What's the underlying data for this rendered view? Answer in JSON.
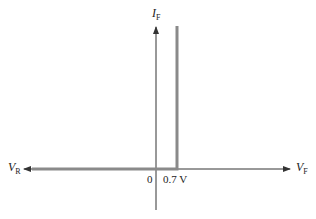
{
  "diagram": {
    "axes": {
      "vertical": {
        "symbol": "I",
        "subscript": "F"
      },
      "horizontal_right": {
        "symbol": "V",
        "subscript": "F"
      },
      "horizontal_left": {
        "symbol": "V",
        "subscript": "R"
      }
    },
    "ticks": {
      "origin": "0",
      "threshold": "0.7 V"
    },
    "colors": {
      "axis": "#333333",
      "curve": "#8a8a8a"
    }
  }
}
